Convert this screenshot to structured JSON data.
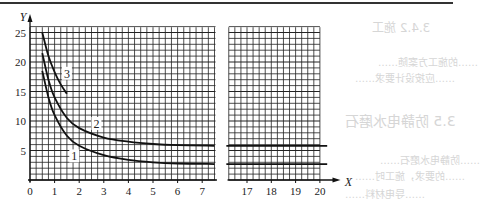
{
  "chart_data": {
    "type": "line",
    "title": "",
    "xlabel": "X",
    "ylabel": "Y",
    "xlim_left_panel": [
      0,
      7.5
    ],
    "xlim_right_panel": [
      16.3,
      20
    ],
    "ylim": [
      0,
      26
    ],
    "x_ticks_left": [
      "0",
      "1",
      "2",
      "3",
      "4",
      "5",
      "6",
      "7"
    ],
    "x_ticks_right": [
      "17",
      "18",
      "19",
      "20"
    ],
    "y_ticks": [
      "5",
      "10",
      "15",
      "20",
      "25"
    ],
    "grid": true,
    "broken_axis": true,
    "series": [
      {
        "name": "1",
        "x": [
          0.5,
          0.75,
          1,
          1.5,
          2,
          3,
          4,
          5,
          6,
          7.5,
          17,
          20
        ],
        "values": [
          18.5,
          14,
          11,
          7.5,
          5.8,
          4.2,
          3.4,
          3.0,
          2.8,
          2.7,
          2.7,
          2.7
        ]
      },
      {
        "name": "2",
        "x": [
          0.5,
          0.75,
          1,
          1.5,
          2,
          3,
          4,
          5,
          6,
          7.5,
          17,
          20
        ],
        "values": [
          21.5,
          17,
          14,
          10.5,
          8.8,
          7.2,
          6.5,
          6.1,
          5.9,
          5.8,
          5.8,
          5.8
        ]
      },
      {
        "name": "3",
        "x": [
          0.5,
          0.75,
          1,
          1.25,
          1.5
        ],
        "values": [
          25,
          21,
          18.3,
          16.2,
          14.6
        ]
      }
    ],
    "annotations": [
      {
        "text": "1",
        "x": 1.8,
        "y": 4
      },
      {
        "text": "2",
        "x": 2.7,
        "y": 9.5
      },
      {
        "text": "3",
        "x": 1.5,
        "y": 18
      }
    ]
  },
  "labels": {
    "y_axis": "Y",
    "x_axis": "X",
    "curve_1": "1",
    "curve_2": "2",
    "curve_3": "3",
    "tick_0": "0"
  },
  "ghost_text": [
    "3.4.2  施工",
    "……的施工方案随……",
    "……应按设计要求……",
    "3.5  防静电水磨石",
    "……防静电水磨石……",
    "……的要求，施工时……",
    "……导电材料……"
  ]
}
